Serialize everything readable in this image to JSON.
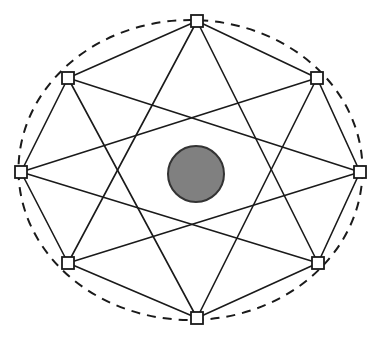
{
  "figure": {
    "width": 381,
    "height": 340,
    "background_color": "#ffffff"
  },
  "chart_data": {
    "type": "diagram",
    "xlabel": "",
    "ylabel": "",
    "center": {
      "x": 190.5,
      "y": 170.0
    },
    "boundary": {
      "shape": "ellipse",
      "center_x": 190.5,
      "center_y": 170.0,
      "radius_x": 172.0,
      "radius_y": 150.0,
      "stroke": "#1a1a1a",
      "stroke_width": 2.0,
      "dash_pattern": "9 7",
      "style": "dashed"
    },
    "center_disc": {
      "shape": "circle",
      "cx": 196.0,
      "cy": 174.0,
      "r": 28.0,
      "fill": "#808080",
      "stroke": "#333333",
      "stroke_width": 2.0
    },
    "node_marker": {
      "shape": "square",
      "size": 12,
      "fill": "#ffffff",
      "stroke": "#1a1a1a",
      "stroke_width": 1.8
    },
    "nodes": [
      {
        "id": "N0",
        "label": "top",
        "angle_deg": 90,
        "x": 197,
        "y": 21
      },
      {
        "id": "N1",
        "label": "upper-right",
        "angle_deg": 45,
        "x": 317,
        "y": 78
      },
      {
        "id": "N2",
        "label": "right",
        "angle_deg": 0,
        "x": 360,
        "y": 172
      },
      {
        "id": "N3",
        "label": "lower-right",
        "angle_deg": 315,
        "x": 318,
        "y": 263
      },
      {
        "id": "N4",
        "label": "bottom",
        "angle_deg": 270,
        "x": 197,
        "y": 318
      },
      {
        "id": "N5",
        "label": "lower-left",
        "angle_deg": 225,
        "x": 68,
        "y": 263
      },
      {
        "id": "N6",
        "label": "left",
        "angle_deg": 180,
        "x": 21,
        "y": 172
      },
      {
        "id": "N7",
        "label": "upper-left",
        "angle_deg": 135,
        "x": 68,
        "y": 78
      }
    ],
    "perimeter_edges": [
      {
        "from": "N0",
        "to": "N1"
      },
      {
        "from": "N1",
        "to": "N2"
      },
      {
        "from": "N2",
        "to": "N3"
      },
      {
        "from": "N3",
        "to": "N4"
      },
      {
        "from": "N4",
        "to": "N5"
      },
      {
        "from": "N5",
        "to": "N6"
      },
      {
        "from": "N6",
        "to": "N7"
      },
      {
        "from": "N7",
        "to": "N0"
      }
    ],
    "chords": [
      {
        "from": "N0",
        "to": "N3"
      },
      {
        "from": "N0",
        "to": "N5"
      },
      {
        "from": "N1",
        "to": "N4"
      },
      {
        "from": "N1",
        "to": "N6"
      },
      {
        "from": "N2",
        "to": "N5"
      },
      {
        "from": "N2",
        "to": "N7"
      },
      {
        "from": "N3",
        "to": "N6"
      },
      {
        "from": "N4",
        "to": "N7"
      }
    ],
    "edge_style": {
      "stroke": "#1a1a1a",
      "stroke_width": 1.6
    },
    "chord_style": {
      "stroke": "#1a1a1a",
      "stroke_width": 1.6
    },
    "counts": {
      "nodes": 8,
      "perimeter_edges": 8,
      "chords": 8,
      "total_segments": 16
    },
    "legend": [],
    "annotations": [],
    "grid": false
  }
}
